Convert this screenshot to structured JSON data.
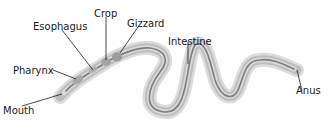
{
  "diagram": {
    "labels": {
      "mouth": "Mouth",
      "pharynx": "Pharynx",
      "esophagus": "Esophagus",
      "crop": "Crop",
      "gizzard": "Gizzard",
      "intestine": "Intestine",
      "anus": "Anus"
    },
    "colors": {
      "body_outer": "#d4d4d4",
      "body_mid": "#b5b5b5",
      "gut": "#8a8a8a",
      "leader_line": "#1a1a1a"
    }
  }
}
